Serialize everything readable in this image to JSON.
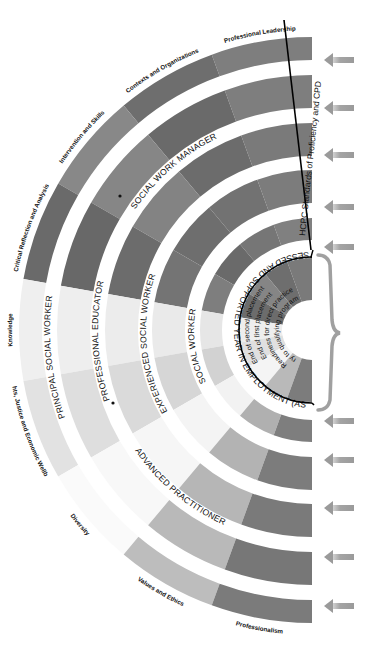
{
  "diagram": {
    "center": {
      "x": 312,
      "y": 330
    },
    "domains": [
      {
        "label": "Professional Leadership",
        "shades": [
          "#7e7e7e",
          "#7e7e7e",
          "#7a7a7a",
          "#7c7c7c",
          "#808080"
        ]
      },
      {
        "label": "Contexts and Organizations",
        "shades": [
          "#6e6e6e",
          "#6a6a6a",
          "#6c6c6c",
          "#727272",
          "#767676"
        ]
      },
      {
        "label": "Intervention and Skills",
        "shades": [
          "#888888",
          "#868686",
          "#838383",
          "#6e6e6e",
          "#6a6a6a"
        ]
      },
      {
        "label": "Critical Reflection and Analysis",
        "shades": [
          "#6a6a6a",
          "#686868",
          "#6c6c6c",
          "#747474",
          "#7e7e7e"
        ]
      },
      {
        "label": "Knowledge",
        "shades": [
          "#efefef",
          "#eeeeee",
          "#ececec",
          "#eaeaea",
          "#e6e6e6"
        ]
      },
      {
        "label": "Rights, Justice and Economic Wellbeing",
        "shades": [
          "#e2e2e2",
          "#dedede",
          "#dadada",
          "#d6d6d6",
          "#d2d2d2"
        ]
      },
      {
        "label": "Diversity",
        "shades": [
          "#fafafa",
          "#f8f8f8",
          "#f6f6f6",
          "#f4f4f4",
          "#f2f2f2"
        ]
      },
      {
        "label": "Values and Ethics",
        "shades": [
          "#bdbdbd",
          "#b9b9b9",
          "#b6b6b6",
          "#b3b3b3",
          "#b0b0b0"
        ]
      },
      {
        "label": "Professionalism",
        "shades": [
          "#7b7b7b",
          "#777777",
          "#7a7a7a",
          "#7c7c7c",
          "#7e7e7e"
        ]
      }
    ],
    "rings": [
      {
        "name": "principal-social-worker",
        "inner": 270,
        "outer": 293
      },
      {
        "name": "professional-educator",
        "inner": 222,
        "outer": 255
      },
      {
        "name": "experienced-social-worker",
        "inner": 174,
        "outer": 207
      },
      {
        "name": "social-worker",
        "inner": 127,
        "outer": 160
      },
      {
        "name": "asye",
        "inner": 90,
        "outer": 112
      }
    ],
    "ring_labels": [
      {
        "text": "PRINCIPAL SOCIAL WORKER",
        "radius": 262,
        "start": 72,
        "end": 120
      },
      {
        "text": "PROFESSIONAL EDUCATOR",
        "radius": 214,
        "start": 70,
        "end": 116
      },
      {
        "text": "SOCIAL WORK MANAGER",
        "radius": 214,
        "start": 22,
        "end": 60
      },
      {
        "text": "EXPERIENCED  SOCIAL  WORKER",
        "radius": 166,
        "start": 68,
        "end": 122
      },
      {
        "text": "ADVANCED  PRACTITIONER",
        "radius": 214,
        "start": 120,
        "end": 160
      },
      {
        "text": "SOCIAL  WORKER",
        "radius": 118,
        "start": 78,
        "end": 118
      },
      {
        "text": "ASSESSED AND SUPPORTED YEAR IN EMPLOYMENT (ASYE)",
        "radius": 78,
        "start": 4,
        "end": 176
      }
    ],
    "stage_labels": [
      {
        "text": "End of second placement",
        "radius": 63
      },
      {
        "text": "End of first placement",
        "radius": 53
      },
      {
        "text": "Readiness for direct practice",
        "radius": 43
      },
      {
        "text": "Entry to qualifying programmes",
        "radius": 33
      }
    ],
    "hcpc_label": "HCPC Standards of Proficiency and CPD",
    "arrow_positions_y": [
      60,
      108,
      155,
      207,
      247,
      421,
      460,
      508,
      557,
      606
    ],
    "bullets": [
      {
        "x": 120,
        "y": 196
      },
      {
        "x": 113,
        "y": 403
      }
    ],
    "colors": {
      "arrow": "#9a9a9a",
      "bracket": "#a0a0a0",
      "divider": "#000000",
      "stage_inner": "#7a7a7a"
    }
  }
}
